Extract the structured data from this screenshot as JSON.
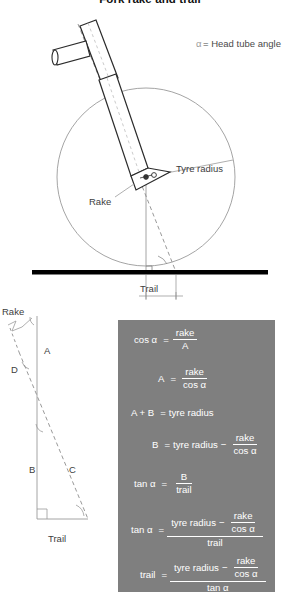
{
  "title": "Fork rake and trail",
  "legend": {
    "symbol": "α",
    "text": "= Head tube angle"
  },
  "diagram": {
    "labels": {
      "tyre_radius": "Tyre radius",
      "rake": "Rake",
      "trail": "Trail"
    }
  },
  "triangle": {
    "labels": {
      "rake": "Rake",
      "trail": "Trail",
      "side_a": "A",
      "side_b": "B",
      "side_c": "C",
      "side_d": "D"
    }
  },
  "formulas": {
    "eq1": {
      "lhs": "cos α",
      "eq": "=",
      "num": "rake",
      "den": "A"
    },
    "eq2": {
      "lhs": "A",
      "eq": "=",
      "num": "rake",
      "den": "cos α"
    },
    "eq3": {
      "lhs": "A + B",
      "eq": "=",
      "rhs": "tyre radius"
    },
    "eq4": {
      "lhs": "B",
      "eq": "=",
      "term": "tyre radius",
      "minus": "−",
      "num": "rake",
      "den": "cos α"
    },
    "eq5": {
      "lhs": "tan α",
      "eq": "=",
      "num": "B",
      "den": "trail"
    },
    "eq6": {
      "lhs": "tan α",
      "eq": "=",
      "term": "tyre radius",
      "minus": "−",
      "num": "rake",
      "den": "cos α",
      "bigden": "trail"
    },
    "eq7": {
      "lhs": "trail",
      "eq": "=",
      "term": "tyre radius",
      "minus": "−",
      "num": "rake",
      "den": "cos α",
      "bigden": "tan α"
    }
  },
  "colors": {
    "panel_bg": "#7f7f7f",
    "panel_text": "#ffffff",
    "ground": "#000000",
    "line": "#8a8a8a",
    "label_text": "#3d3d3d"
  }
}
